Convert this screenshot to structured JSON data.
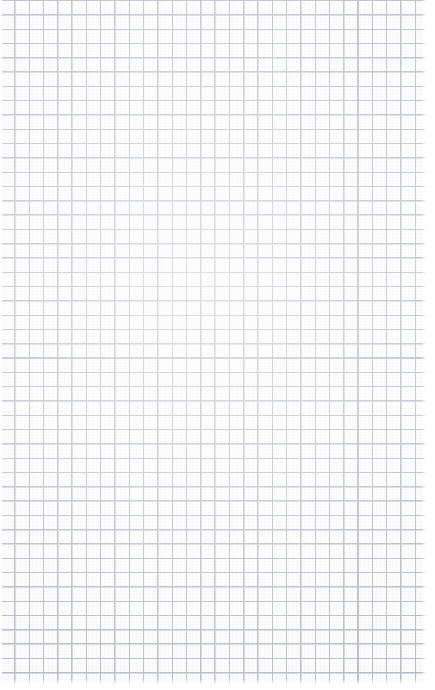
{
  "document": {
    "kind": "grid-paper-scan",
    "description": "Blank square-ruled graph paper sheet",
    "width_px": 435,
    "height_px": 690,
    "has_text": false,
    "has_handwriting": false,
    "has_drawings": false
  },
  "paper": {
    "background_color": "#fcfcfd",
    "page_background_color": "#ffffff"
  },
  "grid": {
    "style": "square",
    "cell_size_px": 14.3,
    "line_color": "#b9bdc5",
    "line_width_px": 1,
    "columns": 30,
    "rows": 48,
    "origin_x_px": 0,
    "origin_y_px": 0,
    "uniform_weight": true,
    "major_gridlines": false
  },
  "margins": {
    "left_px": 2,
    "right_px": 9,
    "top_px": 0,
    "bottom_px": 6,
    "color": "#ffffff"
  }
}
